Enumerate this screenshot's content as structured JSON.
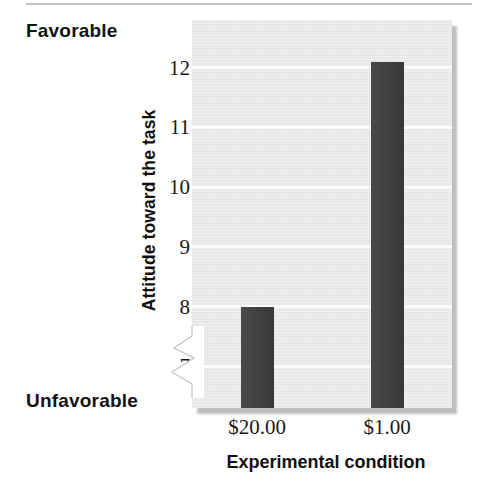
{
  "chart_data": {
    "type": "bar",
    "title": "",
    "xlabel": "Experimental condition",
    "ylabel": "Attitude toward the task",
    "categories": [
      "$20.00",
      "$1.00"
    ],
    "values": [
      8.0,
      12.1
    ],
    "ylim": [
      6.3,
      12.8
    ],
    "yticks": [
      7,
      8,
      9,
      10,
      11,
      12
    ],
    "ytick_labels": [
      "7",
      "8",
      "9",
      "10",
      "11",
      "12"
    ],
    "grid": "horizontal",
    "legend": "none",
    "axis_break": true,
    "annotations": {
      "y_axis_high_anchor": "Favorable",
      "y_axis_low_anchor": "Unfavorable"
    },
    "colors": {
      "bar": "#3c3c3c",
      "plot_background": "#e9e9e9",
      "gridline": "#fbfbfb",
      "text": "#111111",
      "top_rule": "#b9b9bc",
      "shadow": "#a9a9a9"
    }
  },
  "labels": {
    "favorable": "Favorable",
    "unfavorable": "Unfavorable",
    "y_axis_title": "Attitude toward the task",
    "x_axis_title": "Experimental condition",
    "y_tick_7": "7",
    "y_tick_8": "8",
    "y_tick_9": "9",
    "y_tick_10": "10",
    "y_tick_11": "11",
    "y_tick_12": "12",
    "x_tick_1": "$20.00",
    "x_tick_2": "$1.00"
  }
}
